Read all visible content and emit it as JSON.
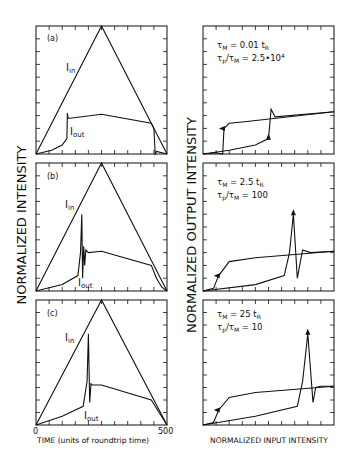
{
  "figure": {
    "left_ylabel": "NORMALIZED INTENSITY",
    "right_ylabel": "NORMALIZED OUTPUT INTENSITY",
    "left_xlabel": "TIME (units of roundtrip time)",
    "right_xlabel": "NORMALIZED INPUT INTENSITY",
    "x_tick_start": "0",
    "x_tick_end": "500",
    "label_in": "I",
    "label_in_sub": "in",
    "label_out": "I",
    "label_out_sub": "out"
  },
  "panels": [
    {
      "tag": "(a)",
      "tau_m": "τ",
      "tau_m_sub": "M",
      "tau_m_val": " = 0.01 t",
      "tau_m_val_sub": "R",
      "ratio_a": "τ",
      "ratio_a_sub": "p",
      "ratio_b": "/τ",
      "ratio_b_sub": "M",
      "ratio_val": " = 2.5•10",
      "ratio_sup": "4"
    },
    {
      "tag": "(b)",
      "tau_m": "τ",
      "tau_m_sub": "M",
      "tau_m_val": " = 2.5 t",
      "tau_m_val_sub": "R",
      "ratio_a": "τ",
      "ratio_a_sub": "p",
      "ratio_b": "/τ",
      "ratio_b_sub": "M",
      "ratio_val": " = 100",
      "ratio_sup": ""
    },
    {
      "tag": "(c)",
      "tau_m": "τ",
      "tau_m_sub": "M",
      "tau_m_val": " = 25 t",
      "tau_m_val_sub": "R",
      "ratio_a": "τ",
      "ratio_a_sub": "p",
      "ratio_b": "/τ",
      "ratio_b_sub": "M",
      "ratio_val": " = 10",
      "ratio_sup": ""
    }
  ],
  "chart_data": [
    {
      "type": "line",
      "title": "(a) Time response",
      "xlabel": "TIME (units of roundtrip time)",
      "ylabel": "NORMALIZED INTENSITY",
      "xlim": [
        0,
        500
      ],
      "series": [
        {
          "name": "I_in",
          "x": [
            0,
            250,
            500
          ],
          "y": [
            0,
            1.0,
            0
          ]
        },
        {
          "name": "I_out",
          "x": [
            0,
            60,
            100,
            118,
            120,
            122,
            130,
            250,
            440,
            450,
            455,
            460,
            500
          ],
          "y": [
            0,
            0.03,
            0.07,
            0.12,
            0.32,
            0.28,
            0.28,
            0.31,
            0.24,
            0.2,
            0.0,
            0.02,
            0.0
          ]
        }
      ]
    },
    {
      "type": "line",
      "title": "(a) Hysteresis",
      "xlabel": "NORMALIZED INPUT INTENSITY",
      "ylabel": "NORMALIZED OUTPUT INTENSITY",
      "annotations": [
        "τM = 0.01 tR",
        "τp/τM = 2.5•10^4"
      ],
      "series": [
        {
          "name": "up",
          "x": [
            0,
            0.2,
            0.4,
            0.5,
            0.52,
            0.55,
            1.0
          ],
          "y": [
            0,
            0.03,
            0.07,
            0.12,
            0.35,
            0.29,
            0.33
          ]
        },
        {
          "name": "down",
          "x": [
            1.0,
            0.3,
            0.2,
            0.16,
            0.15,
            0.1,
            0
          ],
          "y": [
            0.33,
            0.25,
            0.24,
            0.2,
            0.0,
            0.01,
            0
          ]
        }
      ]
    },
    {
      "type": "line",
      "title": "(b) Time response",
      "xlabel": "TIME (units of roundtrip time)",
      "ylabel": "NORMALIZED INTENSITY",
      "xlim": [
        0,
        500
      ],
      "series": [
        {
          "name": "I_in",
          "x": [
            0,
            250,
            500
          ],
          "y": [
            0,
            1.0,
            0
          ]
        },
        {
          "name": "I_out",
          "x": [
            0,
            100,
            160,
            170,
            175,
            178,
            182,
            186,
            190,
            200,
            250,
            440,
            460,
            480,
            500
          ],
          "y": [
            0,
            0.05,
            0.12,
            0.3,
            0.6,
            0.1,
            0.35,
            0.2,
            0.32,
            0.3,
            0.31,
            0.2,
            0.1,
            0.03,
            0
          ]
        }
      ]
    },
    {
      "type": "line",
      "title": "(b) Hysteresis",
      "xlabel": "NORMALIZED INPUT INTENSITY",
      "ylabel": "NORMALIZED OUTPUT INTENSITY",
      "annotations": [
        "τM = 2.5 tR",
        "τp/τM = 100"
      ],
      "series": [
        {
          "name": "up",
          "x": [
            0,
            0.4,
            0.62,
            0.66,
            0.69,
            0.72,
            0.76,
            0.82,
            1.0
          ],
          "y": [
            0,
            0.05,
            0.12,
            0.3,
            0.6,
            0.1,
            0.32,
            0.3,
            0.31
          ]
        },
        {
          "name": "down",
          "x": [
            1.0,
            0.4,
            0.2,
            0.12,
            0.08,
            0
          ],
          "y": [
            0.31,
            0.26,
            0.23,
            0.12,
            0.02,
            0
          ]
        }
      ]
    },
    {
      "type": "line",
      "title": "(c) Time response",
      "xlabel": "TIME (units of roundtrip time)",
      "ylabel": "NORMALIZED INTENSITY",
      "xlim": [
        0,
        500
      ],
      "series": [
        {
          "name": "I_in",
          "x": [
            0,
            250,
            500
          ],
          "y": [
            0,
            1.0,
            0
          ]
        },
        {
          "name": "I_out",
          "x": [
            0,
            100,
            180,
            195,
            200,
            205,
            210,
            215,
            250,
            440,
            470,
            500
          ],
          "y": [
            0,
            0.07,
            0.15,
            0.35,
            0.73,
            0.18,
            0.33,
            0.32,
            0.32,
            0.2,
            0.1,
            0
          ]
        }
      ]
    },
    {
      "type": "line",
      "title": "(c) Hysteresis",
      "xlabel": "NORMALIZED INPUT INTENSITY",
      "ylabel": "NORMALIZED OUTPUT INTENSITY",
      "annotations": [
        "τM = 25 tR",
        "τp/τM = 10"
      ],
      "series": [
        {
          "name": "up",
          "x": [
            0,
            0.4,
            0.72,
            0.76,
            0.8,
            0.84,
            0.86,
            0.9,
            1.0
          ],
          "y": [
            0,
            0.07,
            0.15,
            0.35,
            0.73,
            0.18,
            0.3,
            0.31,
            0.31
          ]
        },
        {
          "name": "down",
          "x": [
            1.0,
            0.4,
            0.2,
            0.12,
            0.08,
            0
          ],
          "y": [
            0.31,
            0.26,
            0.22,
            0.12,
            0.02,
            0
          ]
        }
      ]
    }
  ]
}
